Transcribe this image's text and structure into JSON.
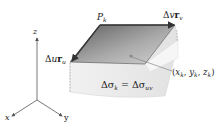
{
  "diagram": {
    "type": "surface-area-element",
    "labels": {
      "axis_z": "z",
      "axis_x": "x",
      "axis_y": "y",
      "point_corner": {
        "main": "P",
        "sub": "k"
      },
      "vector_v": {
        "delta": "Δ",
        "var": "v",
        "vec": "r",
        "sub": "v"
      },
      "vector_u": {
        "delta": "Δ",
        "var": "u",
        "vec": "r",
        "sub": "u"
      },
      "sample_point": {
        "open": "(",
        "x": "x",
        "xs": "k",
        "y": "y",
        "ys": "k",
        "z": "z",
        "zs": "k",
        "close": ")",
        "sep": ", "
      },
      "area_equation": {
        "lhs": "Δσ",
        "lhs_sub": "k",
        "eq": " = ",
        "rhs": "Δσ",
        "rhs_sub": "uv"
      }
    },
    "colors": {
      "parallelogram_dark": "#6e6e6e",
      "parallelogram_light": "#c9c9c9",
      "surface_light": "#ececec",
      "surface_edge": "#d8d8d8",
      "axis": "#555555",
      "vector_arrow": "#333333",
      "point": "#8a8a8a"
    }
  }
}
